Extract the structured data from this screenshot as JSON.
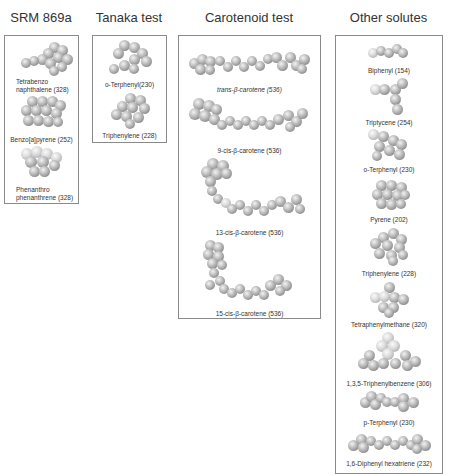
{
  "figure": {
    "groups": [
      {
        "title": "SRM 869a",
        "items": [
          {
            "label_line1": "Tetrabenzo",
            "label_line2": "naphthalene (328)"
          },
          {
            "label": "Benzo[a]pyrene (252)"
          },
          {
            "label_line1": "Phenanthro",
            "label_line2": "phenanthrene (328)"
          }
        ]
      },
      {
        "title": "Tanaka test",
        "items": [
          {
            "label": "o-Terphenyl(230)"
          },
          {
            "label": "Triphenylene (228)"
          }
        ]
      },
      {
        "title": "Carotenoid test",
        "items": [
          {
            "label": "trans-β-carotene (536)"
          },
          {
            "label": "9-cis-β-carotene (536)"
          },
          {
            "label": "13-cis-β-carotene (536)"
          },
          {
            "label": "15-cis-β-carotene (536)"
          }
        ]
      },
      {
        "title": "Other solutes",
        "items": [
          {
            "label": "Biphenyl (154)"
          },
          {
            "label": "Triptycene (254)"
          },
          {
            "label": "o-Terphenyl (230)"
          },
          {
            "label": "Pyrene (202)"
          },
          {
            "label": "Triphenylene (228)"
          },
          {
            "label": "Tetraphenylmethane (320)"
          },
          {
            "label": "1,3,5-Triphenylbenzene (306)"
          },
          {
            "label": "p-Terphenyl (230)"
          },
          {
            "label": "1,6-Diphenyl hexatriene (232)"
          }
        ]
      }
    ]
  }
}
